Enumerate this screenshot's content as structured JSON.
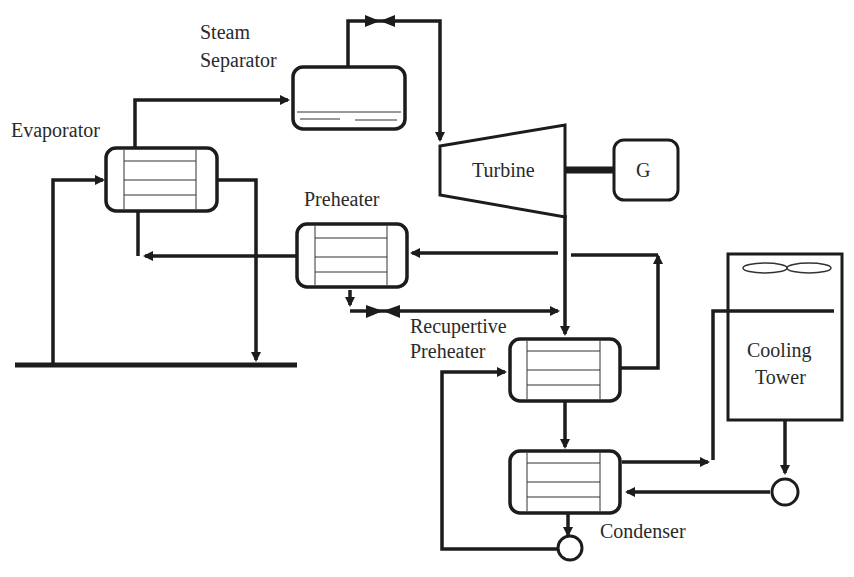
{
  "diagram": {
    "type": "process-flow",
    "components": [
      {
        "id": "evaporator",
        "label": "Evaporator",
        "kind": "heat-exchanger"
      },
      {
        "id": "steam-separator",
        "label_lines": [
          "Steam",
          "Separator"
        ],
        "kind": "separator-vessel"
      },
      {
        "id": "turbine",
        "label": "Turbine",
        "kind": "turbine"
      },
      {
        "id": "generator",
        "label": "G",
        "kind": "generator"
      },
      {
        "id": "preheater",
        "label": "Preheater",
        "kind": "heat-exchanger"
      },
      {
        "id": "recuperative-preheater",
        "label_lines": [
          "Recupertive",
          "Preheater"
        ],
        "kind": "heat-exchanger"
      },
      {
        "id": "cooling-tower",
        "label_lines": [
          "Cooling",
          "Tower"
        ],
        "kind": "cooling-tower"
      },
      {
        "id": "condenser",
        "label": "Condenser",
        "kind": "heat-exchanger"
      },
      {
        "id": "condensate-pump",
        "kind": "pump"
      },
      {
        "id": "cooling-water-pump",
        "kind": "pump"
      }
    ],
    "valves": [
      {
        "id": "steam-throttle-valve",
        "location": "between steam separator and turbine"
      },
      {
        "id": "preheater-outlet-valve",
        "location": "below preheater"
      }
    ],
    "stroke_color": "#1c1c1c",
    "background": "#ffffff"
  },
  "labels": {
    "evaporator": "Evaporator",
    "steam_1": "Steam",
    "steam_2": "Separator",
    "turbine": "Turbine",
    "generator": "G",
    "preheater": "Preheater",
    "recup_1": "Recupertive",
    "recup_2": "Preheater",
    "cooling_1": "Cooling",
    "cooling_2": "Tower",
    "condenser": "Condenser"
  }
}
